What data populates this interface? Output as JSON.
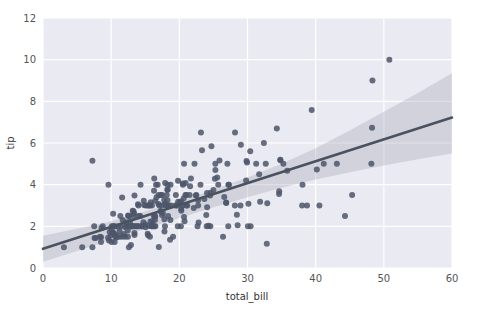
{
  "figure": {
    "background_color": "#ffffff",
    "axes_background_color": "#eaeaf2",
    "grid_color": "#ffffff",
    "tick_label_color": "#555555",
    "axis_title_color": "#333333"
  },
  "chart_data": {
    "type": "scatter",
    "title": "",
    "subtitle": "",
    "xlabel": "total_bill",
    "ylabel": "tip",
    "xlim": [
      0,
      60
    ],
    "ylim": [
      0,
      12
    ],
    "xticks": [
      0,
      10,
      20,
      30,
      40,
      50,
      60
    ],
    "yticks": [
      0,
      2,
      4,
      6,
      8,
      10,
      12
    ],
    "xtick_labels": [
      "0",
      "10",
      "20",
      "30",
      "40",
      "50",
      "60"
    ],
    "ytick_labels": [
      "0",
      "2",
      "4",
      "6",
      "8",
      "10",
      "12"
    ],
    "grid": true,
    "grid_color": "#ffffff",
    "legend": null,
    "legend_position": "none",
    "annotations": [],
    "marker_color": "#4c566a",
    "marker_size": 3,
    "marker_opacity": 0.85,
    "regression": {
      "type": "linear",
      "line_color": "#4a5260",
      "line_width": 2.6,
      "slope": 0.105,
      "intercept": 0.92,
      "x_start": 0,
      "x_end": 60,
      "y_start": 0.92,
      "y_end": 7.22,
      "confidence_band": {
        "color": "#9aa0ae",
        "opacity": 0.32,
        "upper": [
          [
            0,
            1.55
          ],
          [
            5,
            1.88
          ],
          [
            10,
            2.25
          ],
          [
            15,
            2.72
          ],
          [
            20,
            3.22
          ],
          [
            25,
            3.76
          ],
          [
            30,
            4.34
          ],
          [
            35,
            5.0
          ],
          [
            40,
            5.75
          ],
          [
            45,
            6.6
          ],
          [
            50,
            7.5
          ],
          [
            55,
            8.4
          ],
          [
            60,
            9.35
          ]
        ],
        "lower": [
          [
            0,
            0.3
          ],
          [
            5,
            0.82
          ],
          [
            10,
            1.35
          ],
          [
            15,
            1.88
          ],
          [
            20,
            2.4
          ],
          [
            25,
            2.92
          ],
          [
            30,
            3.4
          ],
          [
            35,
            3.85
          ],
          [
            40,
            4.25
          ],
          [
            45,
            4.6
          ],
          [
            50,
            4.92
          ],
          [
            55,
            5.22
          ],
          [
            60,
            5.5
          ]
        ]
      }
    },
    "points": [
      [
        16.99,
        1.01
      ],
      [
        10.34,
        1.66
      ],
      [
        21.01,
        3.5
      ],
      [
        23.68,
        3.31
      ],
      [
        24.59,
        3.61
      ],
      [
        25.29,
        4.71
      ],
      [
        8.77,
        2.0
      ],
      [
        26.88,
        3.12
      ],
      [
        15.04,
        1.96
      ],
      [
        14.78,
        3.23
      ],
      [
        10.27,
        1.71
      ],
      [
        35.26,
        5.0
      ],
      [
        15.42,
        1.57
      ],
      [
        18.43,
        3.0
      ],
      [
        14.83,
        3.02
      ],
      [
        21.58,
        3.92
      ],
      [
        10.33,
        1.67
      ],
      [
        16.29,
        3.71
      ],
      [
        16.97,
        3.5
      ],
      [
        20.65,
        3.35
      ],
      [
        17.92,
        4.08
      ],
      [
        20.29,
        2.75
      ],
      [
        15.77,
        2.23
      ],
      [
        39.42,
        7.58
      ],
      [
        19.82,
        3.18
      ],
      [
        17.81,
        2.34
      ],
      [
        13.37,
        2.0
      ],
      [
        12.69,
        2.0
      ],
      [
        21.7,
        4.3
      ],
      [
        19.65,
        3.0
      ],
      [
        9.55,
        1.45
      ],
      [
        18.35,
        2.5
      ],
      [
        15.06,
        3.0
      ],
      [
        20.69,
        2.45
      ],
      [
        17.78,
        3.27
      ],
      [
        24.06,
        3.6
      ],
      [
        16.31,
        2.0
      ],
      [
        16.93,
        3.07
      ],
      [
        18.69,
        2.31
      ],
      [
        31.27,
        5.0
      ],
      [
        16.04,
        2.24
      ],
      [
        17.46,
        2.54
      ],
      [
        13.94,
        3.06
      ],
      [
        9.68,
        1.32
      ],
      [
        30.4,
        5.6
      ],
      [
        18.29,
        3.0
      ],
      [
        22.23,
        5.0
      ],
      [
        32.4,
        6.0
      ],
      [
        28.55,
        2.05
      ],
      [
        18.04,
        3.0
      ],
      [
        12.54,
        2.5
      ],
      [
        10.29,
        2.6
      ],
      [
        34.81,
        5.2
      ],
      [
        9.94,
        1.56
      ],
      [
        25.56,
        4.34
      ],
      [
        19.49,
        3.51
      ],
      [
        38.01,
        3.0
      ],
      [
        26.41,
        1.5
      ],
      [
        11.24,
        1.76
      ],
      [
        48.27,
        6.73
      ],
      [
        20.29,
        3.21
      ],
      [
        13.81,
        2.0
      ],
      [
        11.02,
        1.98
      ],
      [
        18.29,
        3.76
      ],
      [
        17.59,
        2.64
      ],
      [
        20.08,
        3.15
      ],
      [
        16.45,
        2.47
      ],
      [
        3.07,
        1.0
      ],
      [
        20.23,
        2.01
      ],
      [
        15.01,
        2.09
      ],
      [
        12.02,
        1.97
      ],
      [
        17.07,
        3.0
      ],
      [
        26.86,
        3.14
      ],
      [
        25.28,
        5.0
      ],
      [
        14.73,
        2.2
      ],
      [
        10.51,
        1.25
      ],
      [
        17.92,
        3.08
      ],
      [
        27.2,
        4.0
      ],
      [
        22.76,
        3.0
      ],
      [
        17.29,
        2.71
      ],
      [
        19.44,
        3.0
      ],
      [
        16.66,
        3.4
      ],
      [
        10.07,
        1.83
      ],
      [
        32.68,
        5.0
      ],
      [
        15.98,
        2.03
      ],
      [
        34.83,
        5.17
      ],
      [
        13.03,
        2.0
      ],
      [
        18.28,
        4.0
      ],
      [
        24.71,
        5.85
      ],
      [
        21.16,
        3.0
      ],
      [
        28.97,
        3.0
      ],
      [
        22.49,
        3.5
      ],
      [
        5.75,
        1.0
      ],
      [
        16.32,
        4.3
      ],
      [
        22.75,
        3.25
      ],
      [
        40.17,
        4.73
      ],
      [
        27.28,
        4.0
      ],
      [
        12.03,
        1.5
      ],
      [
        21.01,
        3.0
      ],
      [
        12.46,
        1.5
      ],
      [
        11.35,
        2.5
      ],
      [
        15.38,
        3.0
      ],
      [
        44.3,
        2.5
      ],
      [
        22.42,
        3.48
      ],
      [
        20.92,
        4.08
      ],
      [
        15.36,
        1.64
      ],
      [
        20.49,
        4.06
      ],
      [
        25.21,
        4.29
      ],
      [
        18.24,
        3.76
      ],
      [
        14.31,
        4.0
      ],
      [
        14.0,
        3.0
      ],
      [
        7.25,
        1.0
      ],
      [
        38.07,
        4.0
      ],
      [
        23.95,
        2.55
      ],
      [
        25.71,
        4.0
      ],
      [
        17.31,
        3.5
      ],
      [
        29.93,
        5.07
      ],
      [
        10.65,
        1.5
      ],
      [
        12.43,
        1.8
      ],
      [
        24.08,
        2.92
      ],
      [
        11.69,
        2.31
      ],
      [
        13.42,
        1.68
      ],
      [
        14.26,
        2.5
      ],
      [
        15.95,
        2.0
      ],
      [
        12.48,
        2.52
      ],
      [
        29.8,
        4.2
      ],
      [
        8.52,
        1.48
      ],
      [
        14.52,
        2.0
      ],
      [
        11.38,
        2.0
      ],
      [
        22.82,
        2.18
      ],
      [
        19.08,
        1.5
      ],
      [
        20.27,
        2.83
      ],
      [
        11.17,
        1.5
      ],
      [
        12.26,
        2.0
      ],
      [
        18.26,
        3.25
      ],
      [
        8.51,
        1.25
      ],
      [
        10.33,
        2.0
      ],
      [
        14.15,
        2.0
      ],
      [
        16.0,
        2.0
      ],
      [
        13.16,
        2.75
      ],
      [
        17.47,
        3.5
      ],
      [
        34.3,
        6.7
      ],
      [
        41.19,
        5.0
      ],
      [
        27.05,
        5.0
      ],
      [
        16.43,
        2.3
      ],
      [
        8.35,
        1.5
      ],
      [
        18.64,
        1.36
      ],
      [
        11.87,
        1.63
      ],
      [
        9.78,
        1.73
      ],
      [
        7.51,
        2.0
      ],
      [
        14.07,
        2.5
      ],
      [
        13.13,
        2.0
      ],
      [
        17.26,
        2.74
      ],
      [
        24.55,
        2.0
      ],
      [
        19.77,
        2.0
      ],
      [
        29.85,
        5.14
      ],
      [
        48.17,
        5.0
      ],
      [
        25.0,
        3.75
      ],
      [
        13.39,
        2.61
      ],
      [
        16.49,
        2.0
      ],
      [
        21.5,
        3.5
      ],
      [
        12.66,
        2.5
      ],
      [
        16.21,
        2.0
      ],
      [
        13.81,
        2.0
      ],
      [
        17.51,
        3.0
      ],
      [
        24.52,
        3.48
      ],
      [
        20.76,
        2.24
      ],
      [
        31.71,
        4.5
      ],
      [
        10.59,
        1.61
      ],
      [
        10.63,
        2.0
      ],
      [
        50.81,
        10.0
      ],
      [
        15.81,
        3.16
      ],
      [
        7.25,
        5.15
      ],
      [
        31.85,
        3.18
      ],
      [
        16.82,
        4.0
      ],
      [
        32.9,
        3.11
      ],
      [
        17.89,
        2.0
      ],
      [
        14.48,
        2.0
      ],
      [
        9.6,
        4.0
      ],
      [
        34.63,
        3.55
      ],
      [
        34.65,
        3.68
      ],
      [
        23.33,
        5.65
      ],
      [
        45.35,
        3.5
      ],
      [
        23.17,
        6.5
      ],
      [
        40.55,
        3.0
      ],
      [
        20.69,
        5.0
      ],
      [
        20.9,
        3.5
      ],
      [
        30.46,
        2.0
      ],
      [
        18.15,
        3.5
      ],
      [
        23.1,
        4.0
      ],
      [
        15.69,
        1.5
      ],
      [
        19.81,
        4.19
      ],
      [
        28.44,
        2.56
      ],
      [
        15.48,
        2.02
      ],
      [
        16.58,
        4.0
      ],
      [
        7.56,
        1.44
      ],
      [
        10.34,
        2.0
      ],
      [
        43.11,
        5.0
      ],
      [
        13.0,
        2.0
      ],
      [
        13.51,
        2.0
      ],
      [
        18.71,
        4.0
      ],
      [
        12.74,
        2.01
      ],
      [
        13.0,
        2.0
      ],
      [
        16.4,
        2.5
      ],
      [
        20.53,
        4.0
      ],
      [
        16.47,
        3.23
      ],
      [
        26.59,
        3.41
      ],
      [
        38.73,
        3.0
      ],
      [
        24.27,
        2.03
      ],
      [
        12.76,
        2.23
      ],
      [
        30.06,
        2.0
      ],
      [
        25.89,
        5.16
      ],
      [
        48.33,
        9.0
      ],
      [
        13.27,
        2.5
      ],
      [
        28.17,
        6.5
      ],
      [
        12.9,
        1.1
      ],
      [
        28.15,
        3.0
      ],
      [
        11.59,
        1.5
      ],
      [
        7.74,
        1.44
      ],
      [
        30.14,
        3.09
      ],
      [
        12.16,
        2.2
      ],
      [
        13.42,
        3.48
      ],
      [
        8.58,
        1.92
      ],
      [
        15.98,
        3.0
      ],
      [
        13.42,
        1.58
      ],
      [
        16.27,
        2.5
      ],
      [
        10.09,
        2.0
      ],
      [
        20.45,
        3.0
      ],
      [
        13.28,
        2.72
      ],
      [
        22.12,
        2.88
      ],
      [
        24.01,
        2.0
      ],
      [
        15.69,
        3.0
      ],
      [
        11.61,
        3.39
      ],
      [
        10.77,
        1.47
      ],
      [
        15.53,
        3.0
      ],
      [
        10.07,
        1.25
      ],
      [
        12.6,
        1.0
      ],
      [
        32.83,
        1.17
      ],
      [
        35.83,
        4.67
      ],
      [
        29.03,
        5.92
      ],
      [
        27.18,
        2.0
      ],
      [
        22.67,
        2.0
      ],
      [
        17.82,
        1.75
      ],
      [
        18.78,
        3.0
      ]
    ]
  }
}
